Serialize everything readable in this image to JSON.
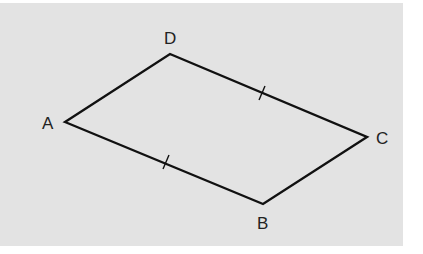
{
  "figure": {
    "type": "parallelogram",
    "background_color": "#e3e3e3",
    "stroke_color": "#111111",
    "vertices": [
      {
        "label": "A",
        "x": 65,
        "y": 122
      },
      {
        "label": "B",
        "x": 263,
        "y": 204
      },
      {
        "label": "C",
        "x": 367,
        "y": 137
      },
      {
        "label": "D",
        "x": 170,
        "y": 54
      }
    ],
    "labels": {
      "A": "A",
      "B": "B",
      "C": "C",
      "D": "D"
    },
    "tick_marks": [
      {
        "side": "AB",
        "count": 1
      },
      {
        "side": "DC",
        "count": 1
      }
    ]
  }
}
